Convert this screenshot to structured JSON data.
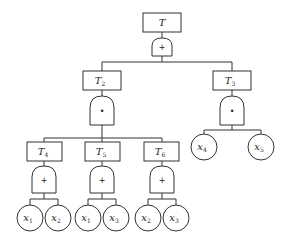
{
  "diagram": {
    "type": "fault-tree",
    "nodes": {
      "T": {
        "label": "T",
        "sub": "",
        "gate": "+"
      },
      "T2": {
        "label": "T",
        "sub": "2",
        "gate": "•"
      },
      "T3": {
        "label": "T",
        "sub": "3",
        "gate": "•"
      },
      "T4": {
        "label": "T",
        "sub": "4",
        "gate": "+"
      },
      "T5": {
        "label": "T",
        "sub": "5",
        "gate": "+"
      },
      "T6": {
        "label": "T",
        "sub": "6",
        "gate": "+"
      }
    },
    "leaves": [
      {
        "label": "x",
        "sub": "1",
        "parent": "T4"
      },
      {
        "label": "x",
        "sub": "2",
        "parent": "T4"
      },
      {
        "label": "x",
        "sub": "1",
        "parent": "T5"
      },
      {
        "label": "x",
        "sub": "3",
        "parent": "T5"
      },
      {
        "label": "x",
        "sub": "2",
        "parent": "T6"
      },
      {
        "label": "x",
        "sub": "3",
        "parent": "T6"
      },
      {
        "label": "x",
        "sub": "4",
        "parent": "T3"
      },
      {
        "label": "x",
        "sub": "5",
        "parent": "T3"
      }
    ],
    "edges": [
      [
        "T",
        "T2"
      ],
      [
        "T",
        "T3"
      ],
      [
        "T2",
        "T4"
      ],
      [
        "T2",
        "T5"
      ],
      [
        "T2",
        "T6"
      ]
    ]
  }
}
